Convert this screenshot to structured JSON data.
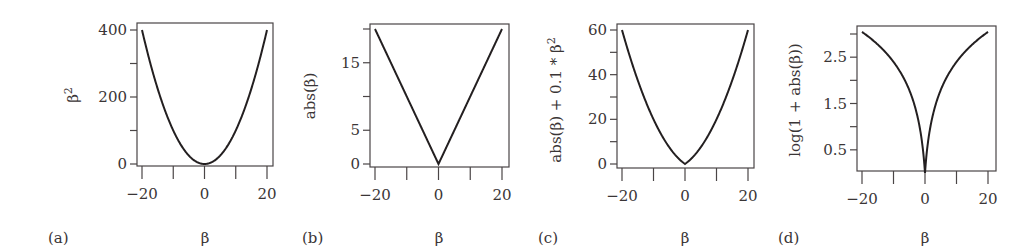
{
  "figure": {
    "background": "#ffffff",
    "line_color": "#231f20",
    "frame_color": "#4a4546"
  },
  "chart_data": [
    {
      "type": "line",
      "panel_label": "(a)",
      "title": "",
      "xlabel": "β",
      "ylabel": "β²",
      "ylabel_base": "β",
      "ylabel_sup": "2",
      "function": "beta^2",
      "xlim": [
        -20,
        20
      ],
      "ylim": [
        0,
        400
      ],
      "x_ticks": [
        -20,
        -10,
        0,
        10,
        20
      ],
      "x_tick_labels": [
        "−20",
        "",
        "0",
        "",
        "20"
      ],
      "y_ticks": [
        0,
        100,
        200,
        300,
        400
      ],
      "y_tick_labels": [
        "0",
        "",
        "200",
        "",
        "400"
      ],
      "x": [
        -20,
        -15,
        -10,
        -5,
        0,
        5,
        10,
        15,
        20
      ],
      "y": [
        400,
        225,
        100,
        25,
        0,
        25,
        100,
        225,
        400
      ],
      "grid": false,
      "legend": null
    },
    {
      "type": "line",
      "panel_label": "(b)",
      "title": "",
      "xlabel": "β",
      "ylabel": "abs(β)",
      "function": "abs(beta)",
      "xlim": [
        -20,
        20
      ],
      "ylim": [
        0,
        20
      ],
      "x_ticks": [
        -20,
        -10,
        0,
        10,
        20
      ],
      "x_tick_labels": [
        "−20",
        "",
        "0",
        "",
        "20"
      ],
      "y_ticks": [
        0,
        5,
        10,
        15,
        20
      ],
      "y_tick_labels": [
        "0",
        "5",
        "",
        "15",
        ""
      ],
      "x": [
        -20,
        -10,
        0,
        10,
        20
      ],
      "y": [
        20,
        10,
        0,
        10,
        20
      ],
      "grid": false,
      "legend": null
    },
    {
      "type": "line",
      "panel_label": "(c)",
      "title": "",
      "xlabel": "β",
      "ylabel": "abs(β) + 0.1 * β²",
      "ylabel_base": "abs(β) + 0.1 * β",
      "ylabel_sup": "2",
      "function": "abs(beta) + 0.1*beta^2",
      "xlim": [
        -20,
        20
      ],
      "ylim": [
        0,
        60
      ],
      "x_ticks": [
        -20,
        -10,
        0,
        10,
        20
      ],
      "x_tick_labels": [
        "−20",
        "",
        "0",
        "",
        "20"
      ],
      "y_ticks": [
        0,
        10,
        20,
        30,
        40,
        50,
        60
      ],
      "y_tick_labels": [
        "0",
        "",
        "20",
        "",
        "40",
        "",
        "60"
      ],
      "x": [
        -20,
        -15,
        -10,
        -5,
        0,
        5,
        10,
        15,
        20
      ],
      "y": [
        60,
        37.5,
        20,
        7.5,
        0,
        7.5,
        20,
        37.5,
        60
      ],
      "grid": false,
      "legend": null
    },
    {
      "type": "line",
      "panel_label": "(d)",
      "title": "",
      "xlabel": "β",
      "ylabel": "log(1 + abs(β))",
      "function": "log(1 + abs(beta))",
      "xlim": [
        -20,
        20
      ],
      "ylim": [
        0,
        3.0
      ],
      "x_ticks": [
        -20,
        -10,
        0,
        10,
        20
      ],
      "x_tick_labels": [
        "−20",
        "",
        "0",
        "",
        "20"
      ],
      "y_ticks": [
        0.5,
        1.0,
        1.5,
        2.0,
        2.5,
        3.0
      ],
      "y_tick_labels": [
        "0.5",
        "",
        "1.5",
        "",
        "2.5",
        ""
      ],
      "x": [
        -20,
        -10,
        -5,
        -1,
        0,
        1,
        5,
        10,
        20
      ],
      "y": [
        3.04,
        2.4,
        1.79,
        0.69,
        0,
        0.69,
        1.79,
        2.4,
        3.04
      ],
      "grid": false,
      "legend": null
    }
  ]
}
